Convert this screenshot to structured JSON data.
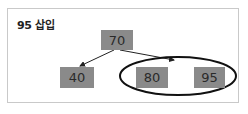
{
  "title": "95 삽입",
  "tree": {
    "root": {
      "label": "70"
    },
    "children": [
      {
        "label": "40"
      },
      {
        "label": "80"
      },
      {
        "label": "95"
      }
    ]
  },
  "highlight": {
    "shape": "ellipse",
    "encloses": [
      "80",
      "95"
    ]
  },
  "colors": {
    "node_fill": "#8a8a8a",
    "node_text": "#2a2a2a",
    "edge": "#222222",
    "frame_border": "#c9c9c9"
  }
}
